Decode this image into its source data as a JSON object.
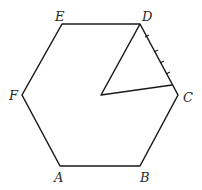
{
  "diagram": {
    "type": "geometry",
    "shape": "regular hexagon",
    "vertices": {
      "A": {
        "label": "A",
        "x": 60,
        "y": 166
      },
      "B": {
        "label": "B",
        "x": 140,
        "y": 166
      },
      "C": {
        "label": "C",
        "x": 178,
        "y": 95
      },
      "D": {
        "label": "D",
        "x": 140,
        "y": 24
      },
      "E": {
        "label": "E",
        "x": 62,
        "y": 24
      },
      "F": {
        "label": "F",
        "x": 22,
        "y": 95
      }
    },
    "triangle": {
      "description": "Triangle inside hexagon with vertex D, an interior point near center, and a point on side DC",
      "points": [
        {
          "x": 140,
          "y": 24
        },
        {
          "x": 101,
          "y": 95
        },
        {
          "x": 172,
          "y": 85
        }
      ]
    },
    "tick_marks_on": "DC",
    "tick_count": 4
  }
}
